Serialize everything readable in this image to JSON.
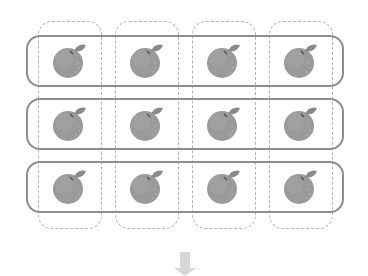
{
  "diagram": {
    "rows": 3,
    "columns": 4,
    "items": [
      {
        "row": 0,
        "col": 0,
        "icon": "orange-icon"
      },
      {
        "row": 0,
        "col": 1,
        "icon": "orange-icon"
      },
      {
        "row": 0,
        "col": 2,
        "icon": "orange-icon"
      },
      {
        "row": 0,
        "col": 3,
        "icon": "orange-icon"
      },
      {
        "row": 1,
        "col": 0,
        "icon": "orange-icon"
      },
      {
        "row": 1,
        "col": 1,
        "icon": "orange-icon"
      },
      {
        "row": 1,
        "col": 2,
        "icon": "orange-icon"
      },
      {
        "row": 1,
        "col": 3,
        "icon": "orange-icon"
      },
      {
        "row": 2,
        "col": 0,
        "icon": "orange-icon"
      },
      {
        "row": 2,
        "col": 1,
        "icon": "orange-icon"
      },
      {
        "row": 2,
        "col": 2,
        "icon": "orange-icon"
      },
      {
        "row": 2,
        "col": 3,
        "icon": "orange-icon"
      }
    ],
    "row_group_style": "solid",
    "column_group_style": "dashed",
    "bottom_icon": "down-arrow-icon",
    "colors": {
      "row_outline": "#8e8e8e",
      "column_outline": "#b4b4b4",
      "orange_fill": "#9a9a9a",
      "leaf_fill": "#8a8a8a",
      "arrow_fill": "#d6d6d6"
    }
  }
}
